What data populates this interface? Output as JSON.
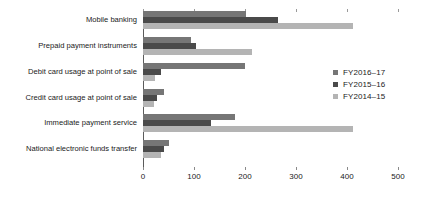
{
  "chart_data": {
    "type": "bar",
    "orientation": "horizontal",
    "title": "",
    "subtitle": "",
    "xlabel": "",
    "ylabel": "",
    "xlim": [
      0,
      500
    ],
    "xticks": [
      0,
      100,
      200,
      300,
      400,
      500
    ],
    "xtick_labels": [
      "0",
      "100",
      "200",
      "300",
      "400",
      "500"
    ],
    "grid": false,
    "legend_position": "right",
    "categories": [
      "Mobile banking",
      "Prepaid payment instruments",
      "Debit card usage at point of sale",
      "Credit card usage at point of sale",
      "Immediate payment service",
      "National electronic funds transfer"
    ],
    "series": [
      {
        "name": "FY2016–17",
        "color": "#767676",
        "values": [
          202,
          94,
          200,
          42,
          180,
          50
        ]
      },
      {
        "name": "FY2015–16",
        "color": "#4a4a4a",
        "values": [
          265,
          104,
          35,
          28,
          133,
          41
        ]
      },
      {
        "name": "FY2014–15",
        "color": "#b4b4b4",
        "values": [
          412,
          214,
          24,
          21,
          412,
          35
        ]
      }
    ]
  },
  "legend": {
    "items": [
      {
        "label": "FY2016–17",
        "color": "#767676"
      },
      {
        "label": "FY2015–16",
        "color": "#4a4a4a"
      },
      {
        "label": "FY2014–15",
        "color": "#b4b4b4"
      }
    ]
  }
}
